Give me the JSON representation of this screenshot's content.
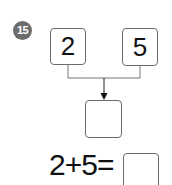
{
  "problem": {
    "number": "15",
    "operand_a": "2",
    "operand_b": "5",
    "result_box": "",
    "equation": "2+5=",
    "answer_box": ""
  }
}
